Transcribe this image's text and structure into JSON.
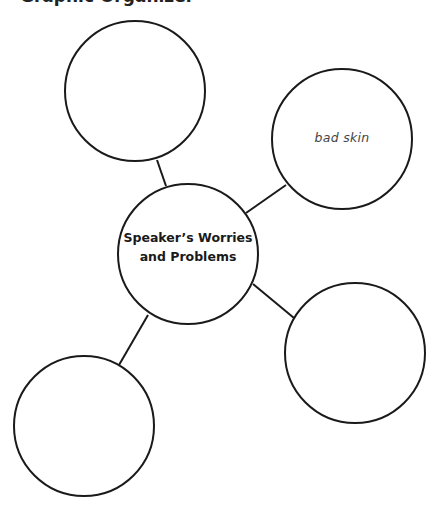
{
  "heading": {
    "text_fragment": "Graphic Organizer"
  },
  "diagram": {
    "type": "web-organizer",
    "center": {
      "label": "Speaker’s Worries\nand Problems",
      "cx": 188,
      "cy": 254,
      "r": 70
    },
    "nodes": [
      {
        "id": "top-left",
        "label": "",
        "cx": 135,
        "cy": 91,
        "r": 70
      },
      {
        "id": "top-right",
        "label": "bad skin",
        "cx": 342,
        "cy": 139,
        "r": 70
      },
      {
        "id": "bottom-right",
        "label": "",
        "cx": 355,
        "cy": 353,
        "r": 70
      },
      {
        "id": "bottom-left",
        "label": "",
        "cx": 84,
        "cy": 426,
        "r": 70
      }
    ],
    "connectors": [
      {
        "to": "top-left",
        "x1": 166,
        "y1": 186,
        "x2": 157,
        "y2": 160
      },
      {
        "to": "top-right",
        "x1": 246,
        "y1": 213,
        "x2": 286,
        "y2": 185
      },
      {
        "to": "bottom-right",
        "x1": 253,
        "y1": 284,
        "x2": 294,
        "y2": 318
      },
      {
        "to": "bottom-left",
        "x1": 148,
        "y1": 315,
        "x2": 119,
        "y2": 365
      }
    ]
  },
  "colors": {
    "stroke": "#1a1a1a",
    "handwriting": "#444444",
    "background": "#ffffff"
  }
}
